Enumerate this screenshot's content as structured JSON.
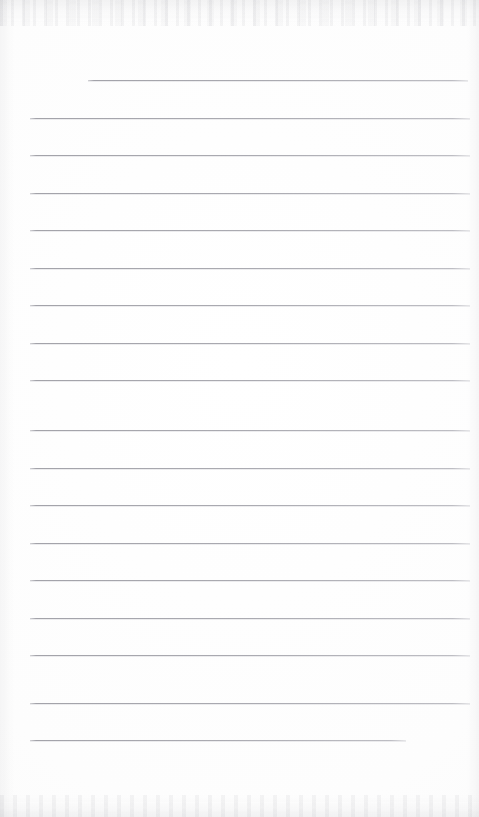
{
  "document": {
    "kind": "scanned-lined-notepaper",
    "title": "Blank ruled notepaper page",
    "page_width": 479,
    "page_height": 817,
    "background_color": "#fefefe",
    "rule_color": "#a6a6ad",
    "rule_thickness": 1,
    "content_text": "",
    "has_handwriting": false,
    "has_printed_text": false
  },
  "layout": {
    "line_count": 18,
    "first_line_y": 80,
    "line_spacing": 37.6,
    "default_left_x": 30,
    "default_right_x": 470,
    "first_line_left_x": 88,
    "last_line_right_x": 406,
    "blank_footer_top_y": 745
  },
  "rules": [
    {
      "index": 1,
      "y": 80,
      "x1": 88,
      "x2": 468,
      "name": "rule-line-1-indented"
    },
    {
      "index": 2,
      "y": 118,
      "x1": 30,
      "x2": 470,
      "name": "rule-line-2"
    },
    {
      "index": 3,
      "y": 155,
      "x1": 30,
      "x2": 470,
      "name": "rule-line-3"
    },
    {
      "index": 4,
      "y": 193,
      "x1": 30,
      "x2": 470,
      "name": "rule-line-4"
    },
    {
      "index": 5,
      "y": 230,
      "x1": 30,
      "x2": 470,
      "name": "rule-line-5"
    },
    {
      "index": 6,
      "y": 268,
      "x1": 30,
      "x2": 470,
      "name": "rule-line-6"
    },
    {
      "index": 7,
      "y": 305,
      "x1": 30,
      "x2": 470,
      "name": "rule-line-7"
    },
    {
      "index": 8,
      "y": 343,
      "x1": 30,
      "x2": 470,
      "name": "rule-line-8"
    },
    {
      "index": 9,
      "y": 380,
      "x1": 30,
      "x2": 470,
      "name": "rule-line-9"
    },
    {
      "index": 10,
      "y": 430,
      "x1": 30,
      "x2": 470,
      "name": "rule-line-10"
    },
    {
      "index": 11,
      "y": 468,
      "x1": 30,
      "x2": 470,
      "name": "rule-line-11"
    },
    {
      "index": 12,
      "y": 505,
      "x1": 30,
      "x2": 470,
      "name": "rule-line-12"
    },
    {
      "index": 13,
      "y": 543,
      "x1": 30,
      "x2": 470,
      "name": "rule-line-13"
    },
    {
      "index": 14,
      "y": 580,
      "x1": 30,
      "x2": 470,
      "name": "rule-line-14"
    },
    {
      "index": 15,
      "y": 618,
      "x1": 30,
      "x2": 470,
      "name": "rule-line-15"
    },
    {
      "index": 16,
      "y": 655,
      "x1": 30,
      "x2": 470,
      "name": "rule-line-16"
    },
    {
      "index": 17,
      "y": 703,
      "x1": 30,
      "x2": 470,
      "name": "rule-line-17"
    },
    {
      "index": 18,
      "y": 740,
      "x1": 30,
      "x2": 406,
      "name": "rule-line-18-short"
    }
  ]
}
